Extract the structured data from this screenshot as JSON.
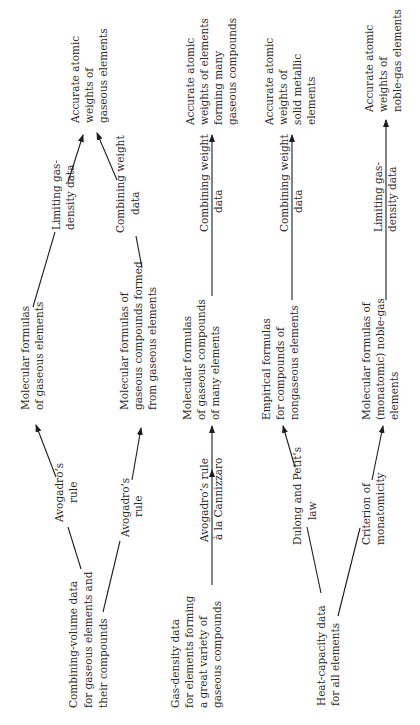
{
  "diagram": {
    "orientation": "rotated 90 degrees counterclockwise",
    "rows": [
      {
        "source": [
          "Combining-volume data",
          "for gaseous elements and",
          "their compounds"
        ],
        "branches": [
          {
            "rule1": [
              "Avogadro’s",
              "rule"
            ],
            "formula": [
              "Molecular formulas",
              "of gaseous elements"
            ],
            "rule2": [
              "Limiting gas-",
              "density data"
            ],
            "result": [
              "Accurate atomic",
              "weights of",
              "gaseous elements"
            ]
          },
          {
            "rule1": [
              "Avogadro’s",
              "rule"
            ],
            "formula": [
              "Molecular formulas of",
              "gaseous compounds formed",
              "from gaseous elements"
            ],
            "rule2": [
              "Combining weight",
              "data"
            ]
          }
        ]
      },
      {
        "source": [
          "Gas-density data",
          "for elements forming",
          "a great variety of",
          "gaseous compounds"
        ],
        "rule1": [
          "Avogadro’s rule",
          "à la Cannizzaro"
        ],
        "formula": [
          "Molecular formulas",
          "of gaseous compounds",
          "of many elements"
        ],
        "rule2": [
          "Combining weight",
          "data"
        ],
        "result": [
          "Accurate atomic",
          "weights of elements",
          "forming many",
          "gaseous compounds"
        ]
      },
      {
        "source": [
          "Heat-capacity data",
          "for all elements"
        ],
        "branches": [
          {
            "rule1": [
              "Dulong and Petit’s",
              "law"
            ],
            "formula": [
              "Empirical formulas",
              "for compounds of",
              "nongaseous elements"
            ],
            "rule2": [
              "Combining weight",
              "data"
            ],
            "result": [
              "Accurate atomic",
              "weights of",
              "solid metallic",
              "elements"
            ]
          },
          {
            "rule1": [
              "Criterion of",
              "monatomicity"
            ],
            "formula": [
              "Molecular formulas of",
              "(monatomic) noble-gas",
              "elements"
            ],
            "rule2": [
              "Limiting gas-",
              "density data"
            ],
            "result": [
              "Accurate atomic",
              "weights of",
              "noble-gas elements"
            ]
          }
        ]
      }
    ]
  }
}
